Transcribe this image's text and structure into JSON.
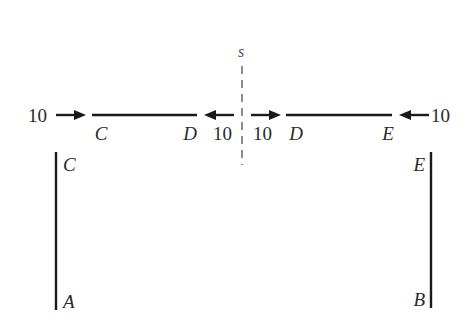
{
  "diagram": {
    "section_label": "s",
    "beam_left": {
      "start_label": "C",
      "end_label": "D",
      "left_force": "10",
      "right_force": "10"
    },
    "beam_right": {
      "start_label": "D",
      "end_label": "E",
      "left_force": "10",
      "right_force": "10"
    },
    "column_left": {
      "top_label": "C",
      "bottom_label": "A"
    },
    "column_right": {
      "top_label": "E",
      "bottom_label": "B"
    }
  }
}
